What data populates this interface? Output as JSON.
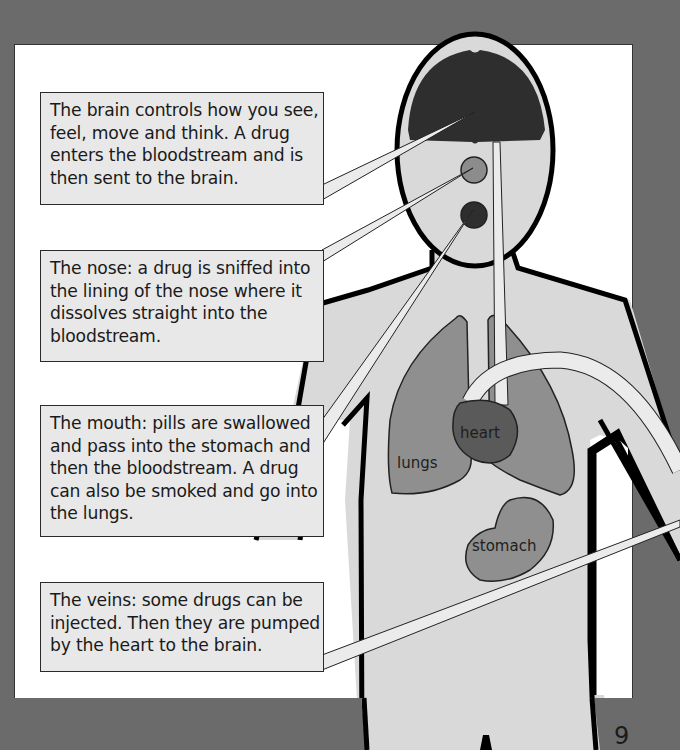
{
  "callouts": {
    "brain": "The brain controls how you see, feel, move and think. A drug enters the bloodstream and is then sent to the brain.",
    "nose": "The nose: a drug is sniffed into the lining of the nose where it dissolves straight into the bloodstream.",
    "mouth": "The mouth: pills are swallowed and pass into the stomach and then the bloodstream. A drug can also be smoked and go into the lungs.",
    "veins": "The veins: some drugs can be injected. Then they are pumped by the heart to the brain."
  },
  "organ_labels": {
    "heart": "heart",
    "lungs": "lungs",
    "stomach": "stomach"
  },
  "page_number": "9",
  "colors": {
    "page_background": "#6b6b6b",
    "panel": "#ffffff",
    "body_fill": "#d9d9d9",
    "brain": "#2e2e2e",
    "lungs": "#8f8f8f",
    "heart": "#5a5a5a",
    "stomach": "#8f8f8f",
    "callout_fill": "#e8e8e8"
  }
}
